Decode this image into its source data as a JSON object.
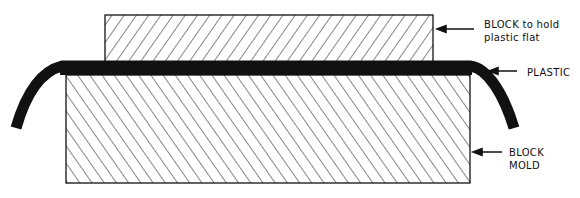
{
  "diagram": {
    "type": "cross-section",
    "colors": {
      "ink": "#111111",
      "background": "#ffffff"
    },
    "components": [
      {
        "id": "upper-block",
        "label_line1": "BLOCK to hold",
        "label_line2": "plastic flat",
        "hatch": "backslash"
      },
      {
        "id": "plastic",
        "label": "PLASTIC",
        "fill": "solid"
      },
      {
        "id": "block-mold",
        "label_line1": "BLOCK",
        "label_line2": "MOLD",
        "hatch": "slash"
      }
    ]
  },
  "labels": {
    "upper_block_1": "BLOCK to hold",
    "upper_block_2": "plastic flat",
    "plastic": "PLASTIC",
    "mold_1": "BLOCK",
    "mold_2": "MOLD"
  }
}
